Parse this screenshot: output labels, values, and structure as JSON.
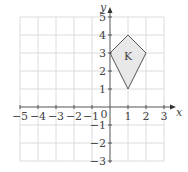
{
  "diagram": {
    "type": "coordinate-grid",
    "x_axis": {
      "label": "x",
      "min": -5,
      "max": 3,
      "ticks": [
        "−5",
        "−4",
        "−3",
        "−2",
        "−1",
        "0",
        "1",
        "2",
        "3"
      ]
    },
    "y_axis": {
      "label": "y",
      "min": -3,
      "max": 5,
      "ticks": [
        "5",
        "4",
        "3",
        "2",
        "1",
        "−1",
        "−2",
        "−3"
      ]
    },
    "shape": {
      "label": "K",
      "vertices": [
        [
          0,
          3
        ],
        [
          1,
          4
        ],
        [
          2,
          3
        ],
        [
          1,
          1
        ]
      ],
      "fill": "#e8e8e8",
      "stroke": "#555555"
    },
    "grid_color": "#dddddd",
    "axis_color": "#555555"
  }
}
